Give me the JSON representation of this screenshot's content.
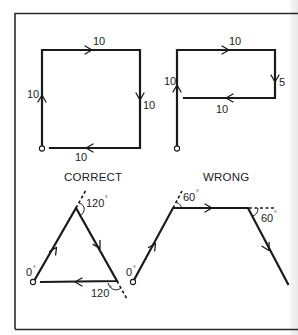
{
  "figure": {
    "frame": {
      "stroke": "#2a2a2a"
    },
    "panels": [
      {
        "name": "square",
        "segments": [
          {
            "side": "left",
            "length_label": "10"
          },
          {
            "side": "top",
            "length_label": "10"
          },
          {
            "side": "right",
            "length_label": "10"
          },
          {
            "side": "bottom",
            "length_label": "10"
          }
        ]
      },
      {
        "name": "open-rectangle",
        "segments": [
          {
            "side": "left",
            "length_label": "10"
          },
          {
            "side": "top",
            "length_label": "10"
          },
          {
            "side": "right",
            "length_label": "5"
          },
          {
            "side": "bottom",
            "length_label": "10"
          }
        ]
      },
      {
        "name": "triangle",
        "caption": "CORRECT",
        "start_angle": "0",
        "turn_angles": [
          "120",
          "120"
        ],
        "degree_symbol": "°"
      },
      {
        "name": "trapezoid-path",
        "caption": "WRONG",
        "start_angle": "0",
        "turn_angles": [
          "60",
          "60"
        ],
        "degree_symbol": "°"
      }
    ]
  }
}
